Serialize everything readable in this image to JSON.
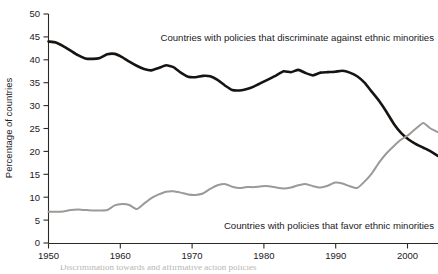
{
  "chart_data": {
    "type": "line",
    "title": "",
    "xlabel": "",
    "ylabel": "Percentage of countries",
    "xlim": [
      1950,
      2003
    ],
    "ylim": [
      0,
      50
    ],
    "xticks": [
      1950,
      1960,
      1970,
      1980,
      1990,
      2000
    ],
    "yticks": [
      0,
      5,
      10,
      15,
      20,
      25,
      30,
      35,
      40,
      45,
      50
    ],
    "grid": false,
    "legend": "inline-annotations",
    "series": [
      {
        "name": "Countries with policies that discriminate against ethnic minorities",
        "color": "#161311",
        "x": [
          1950,
          1951,
          1952,
          1953,
          1954,
          1955,
          1956,
          1957,
          1958,
          1959,
          1960,
          1961,
          1962,
          1963,
          1964,
          1965,
          1966,
          1967,
          1968,
          1969,
          1970,
          1971,
          1972,
          1973,
          1974,
          1975,
          1976,
          1977,
          1978,
          1979,
          1980,
          1981,
          1982,
          1983,
          1984,
          1985,
          1986,
          1987,
          1988,
          1989,
          1990,
          1991,
          1992,
          1993,
          1994,
          1995,
          1996,
          1997,
          1998,
          1999,
          2000,
          2001,
          2002,
          2003
        ],
        "values": [
          44.0,
          43.8,
          43.0,
          42.0,
          41.0,
          40.3,
          40.2,
          40.4,
          41.2,
          41.3,
          40.6,
          39.6,
          38.7,
          38.0,
          37.7,
          38.2,
          38.8,
          38.4,
          37.2,
          36.3,
          36.2,
          36.5,
          36.4,
          35.6,
          34.4,
          33.4,
          33.3,
          33.6,
          34.2,
          35.0,
          35.8,
          36.6,
          37.5,
          37.3,
          37.8,
          37.1,
          36.6,
          37.2,
          37.3,
          37.4,
          37.6,
          37.2,
          36.4,
          35.0,
          33.0,
          31.0,
          28.6,
          26.0,
          24.0,
          22.6,
          21.6,
          20.8,
          20.0,
          19.0
        ]
      },
      {
        "name": "Countries with policies that favor ethnic minorities",
        "color": "#9c9a97",
        "x": [
          1950,
          1951,
          1952,
          1953,
          1954,
          1955,
          1956,
          1957,
          1958,
          1959,
          1960,
          1961,
          1962,
          1963,
          1964,
          1965,
          1966,
          1967,
          1968,
          1969,
          1970,
          1971,
          1972,
          1973,
          1974,
          1975,
          1976,
          1977,
          1978,
          1979,
          1980,
          1981,
          1982,
          1983,
          1984,
          1985,
          1986,
          1987,
          1988,
          1989,
          1990,
          1991,
          1992,
          1993,
          1994,
          1995,
          1996,
          1997,
          1998,
          1999,
          2000,
          2001,
          2002,
          2003
        ],
        "values": [
          6.8,
          6.8,
          6.9,
          7.2,
          7.3,
          7.2,
          7.1,
          7.1,
          7.2,
          8.2,
          8.5,
          8.3,
          7.4,
          8.6,
          9.8,
          10.6,
          11.2,
          11.3,
          11.0,
          10.6,
          10.5,
          10.8,
          11.8,
          12.6,
          12.9,
          12.3,
          12.0,
          12.2,
          12.2,
          12.4,
          12.4,
          12.1,
          11.9,
          12.1,
          12.6,
          12.9,
          12.4,
          12.1,
          12.5,
          13.2,
          13.0,
          12.4,
          12.0,
          13.4,
          15.2,
          17.6,
          19.6,
          21.2,
          22.6,
          23.6,
          25.0,
          26.2,
          25.0,
          24.2
        ]
      }
    ],
    "annotations": [
      {
        "name": "discriminate-label",
        "text": "Countries with policies that discriminate against ethnic minorities",
        "x": 434,
        "y": 41,
        "anchor": "end"
      },
      {
        "name": "favor-label",
        "text": "Countries with policies that favor ethnic minorities",
        "x": 434,
        "y": 229,
        "anchor": "end"
      }
    ]
  },
  "axis": {
    "y_title": "Percentage of countries",
    "y_tick_labels": [
      "50",
      "45",
      "40",
      "35",
      "30",
      "25",
      "20",
      "15",
      "10",
      "5",
      "0"
    ],
    "x_tick_labels": [
      "1950",
      "1960",
      "1970",
      "1980",
      "1990",
      "2000"
    ]
  },
  "caption": {
    "text": "Discrimination towards and affirmative action policies"
  }
}
